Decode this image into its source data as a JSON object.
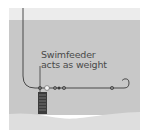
{
  "diagram": {
    "annotation": {
      "line1": "Swimfeeder",
      "line2": "acts as weight"
    },
    "elements": [
      "fishing-line",
      "swimfeeder",
      "bead",
      "stops",
      "swivel",
      "hook",
      "water",
      "lake-bed"
    ],
    "colors": {
      "background": "#ffffff",
      "sky": "#ececec",
      "water": "#c8c8c8",
      "bed": "#dedede",
      "line": "#3a3a3a",
      "feeder": "#3c3c3c"
    }
  }
}
